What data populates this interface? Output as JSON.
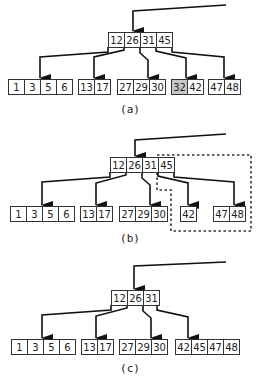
{
  "colors": {
    "stroke": "#333333",
    "cell_fill": "#ffffff",
    "highlight_fill": "#c8c8c8",
    "edge": "#111111",
    "dashed": "#333333"
  },
  "cell_width": 16,
  "cell_height": 15,
  "panels": [
    {
      "id": "a",
      "label": "(a)",
      "label_pos": [
        130,
        113
      ],
      "entry": {
        "points": [
          [
            226,
            5
          ],
          [
            133,
            11
          ],
          [
            133,
            31
          ]
        ]
      },
      "root": {
        "x": 108,
        "y": 32,
        "keys": [
          "12",
          "26",
          "31",
          "45"
        ]
      },
      "leaves": [
        {
          "x": 8,
          "y": 79,
          "keys": [
            "1",
            "3",
            "5",
            "6"
          ],
          "highlight": []
        },
        {
          "x": 78,
          "y": 79,
          "keys": [
            "13",
            "17"
          ],
          "highlight": []
        },
        {
          "x": 117,
          "y": 79,
          "keys": [
            "27",
            "29",
            "30"
          ],
          "highlight": []
        },
        {
          "x": 171,
          "y": 79,
          "keys": [
            "32",
            "42"
          ],
          "highlight": [
            0
          ]
        },
        {
          "x": 208,
          "y": 79,
          "keys": [
            "47",
            "48"
          ],
          "highlight": []
        }
      ],
      "edges": [
        {
          "points": [
            [
              108,
              47
            ],
            [
              108,
              52
            ],
            [
              40,
              57
            ],
            [
              40,
              78
            ]
          ]
        },
        {
          "points": [
            [
              124,
              47
            ],
            [
              124,
              50
            ],
            [
              94,
              57
            ],
            [
              94,
              78
            ]
          ]
        },
        {
          "points": [
            [
              140,
              47
            ],
            [
              140,
              53
            ],
            [
              148,
              60
            ],
            [
              148,
              78
            ]
          ]
        },
        {
          "points": [
            [
              156,
              47
            ],
            [
              156,
              51
            ],
            [
              186,
              58
            ],
            [
              186,
              78
            ]
          ]
        },
        {
          "points": [
            [
              172,
              47
            ],
            [
              172,
              52
            ],
            [
              224,
              57
            ],
            [
              224,
              78
            ]
          ]
        }
      ],
      "dashed": null
    },
    {
      "id": "b",
      "label": "(b)",
      "label_pos": [
        130,
        242
      ],
      "entry": {
        "points": [
          [
            226,
            134
          ],
          [
            135,
            140
          ],
          [
            135,
            156
          ]
        ]
      },
      "root": {
        "x": 110,
        "y": 157,
        "keys": [
          "12",
          "26",
          "31",
          "45"
        ]
      },
      "leaves": [
        {
          "x": 10,
          "y": 206,
          "keys": [
            "1",
            "3",
            "5",
            "6"
          ],
          "highlight": []
        },
        {
          "x": 80,
          "y": 206,
          "keys": [
            "13",
            "17"
          ],
          "highlight": []
        },
        {
          "x": 119,
          "y": 206,
          "keys": [
            "27",
            "29",
            "30"
          ],
          "highlight": []
        },
        {
          "x": 180,
          "y": 206,
          "keys": [
            "42"
          ],
          "highlight": []
        },
        {
          "x": 213,
          "y": 206,
          "keys": [
            "47",
            "48"
          ],
          "highlight": []
        }
      ],
      "edges": [
        {
          "points": [
            [
              110,
              172
            ],
            [
              110,
              177
            ],
            [
              42,
              182
            ],
            [
              42,
              205
            ]
          ]
        },
        {
          "points": [
            [
              126,
              172
            ],
            [
              126,
              175
            ],
            [
              96,
              183
            ],
            [
              96,
              205
            ]
          ]
        },
        {
          "points": [
            [
              142,
              172
            ],
            [
              142,
              178
            ],
            [
              150,
              185
            ],
            [
              150,
              205
            ]
          ]
        },
        {
          "points": [
            [
              158,
              172
            ],
            [
              158,
              176
            ],
            [
              188,
              183
            ],
            [
              188,
              205
            ]
          ]
        },
        {
          "points": [
            [
              174,
              172
            ],
            [
              174,
              177
            ],
            [
              234,
              182
            ],
            [
              234,
              205
            ]
          ]
        }
      ],
      "dashed": {
        "points": [
          [
            157,
            155
          ],
          [
            251,
            155
          ],
          [
            251,
            231
          ],
          [
            171,
            231
          ],
          [
            171,
            190
          ],
          [
            157,
            190
          ],
          [
            157,
            155
          ]
        ]
      }
    },
    {
      "id": "c",
      "label": "(c)",
      "label_pos": [
        130,
        372
      ],
      "entry": {
        "points": [
          [
            226,
            262
          ],
          [
            134,
            266
          ],
          [
            134,
            289
          ]
        ]
      },
      "root": {
        "x": 111,
        "y": 290,
        "keys": [
          "12",
          "26",
          "31"
        ]
      },
      "leaves": [
        {
          "x": 11,
          "y": 339,
          "keys": [
            "1",
            "3",
            "5",
            "6"
          ],
          "highlight": []
        },
        {
          "x": 81,
          "y": 339,
          "keys": [
            "13",
            "17"
          ],
          "highlight": []
        },
        {
          "x": 119,
          "y": 339,
          "keys": [
            "27",
            "29",
            "30"
          ],
          "highlight": []
        },
        {
          "x": 175,
          "y": 339,
          "keys": [
            "42",
            "45",
            "47",
            "48"
          ],
          "highlight": []
        }
      ],
      "edges": [
        {
          "points": [
            [
              111,
              305
            ],
            [
              111,
              310
            ],
            [
              42,
              315
            ],
            [
              42,
              338
            ]
          ]
        },
        {
          "points": [
            [
              127,
              305
            ],
            [
              127,
              308
            ],
            [
              96,
              316
            ],
            [
              96,
              338
            ]
          ]
        },
        {
          "points": [
            [
              143,
              305
            ],
            [
              143,
              311
            ],
            [
              151,
              318
            ],
            [
              151,
              338
            ]
          ]
        },
        {
          "points": [
            [
              157,
              305
            ],
            [
              157,
              310
            ],
            [
              188,
              317
            ],
            [
              188,
              338
            ]
          ]
        }
      ],
      "dashed": null
    }
  ]
}
